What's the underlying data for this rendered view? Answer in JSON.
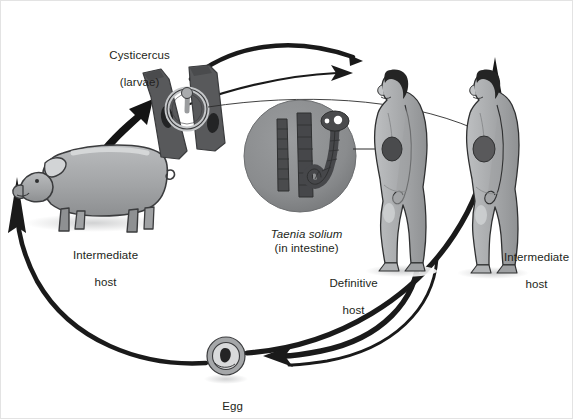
{
  "figure": {
    "background_color": "#ffffff",
    "border_color": "#e3e3e3"
  },
  "labels": {
    "cysticercus": "Cysticercus",
    "cysticercus_sub": "(larvae)",
    "taenia_species": "Taenia solium",
    "taenia_location": "(in intestine)",
    "pig_host_line1": "Intermediate",
    "pig_host_line2": "host",
    "definitive_line1": "Definitive",
    "definitive_line2": "host",
    "human_host_line1": "Intermediate",
    "human_host_line2": "host",
    "egg": "Egg"
  },
  "nodes": [
    {
      "id": "cysticercus-muscle",
      "name": "cysticercus-in-muscle",
      "caption": "Cysticercus (larvae)",
      "role": "larval stage encysted in striated muscle tissue"
    },
    {
      "id": "pig",
      "name": "pig-figure",
      "caption": "Intermediate host",
      "role": "pig intermediate host"
    },
    {
      "id": "tapeworm",
      "name": "tapeworm-circle",
      "caption": "Taenia solium (in intestine)",
      "role": "adult tapeworm proglottids and scolex"
    },
    {
      "id": "human-definitive",
      "name": "human-definitive-host",
      "caption": "Definitive host",
      "role": "human harboring adult tapeworm in intestine"
    },
    {
      "id": "human-intermediate",
      "name": "human-intermediate-host",
      "caption": "Intermediate host",
      "role": "human with cysticerci in tissue"
    },
    {
      "id": "egg",
      "name": "egg-figure",
      "caption": "Egg",
      "role": "egg shed in feces"
    }
  ],
  "arrows": [
    {
      "from": "pig",
      "to": "cysticercus-muscle",
      "style": "tapered-black"
    },
    {
      "from": "cysticercus-muscle",
      "to": "human-definitive",
      "style": "thick-curve-no-head"
    },
    {
      "from": "cysticercus-muscle",
      "to": "human-definitive",
      "style": "thin-curve-arrowhead"
    },
    {
      "from": "human-definitive",
      "to": "egg",
      "style": "thick-curve-arrowhead"
    },
    {
      "from": "human-intermediate",
      "to": "egg",
      "style": "thick-curve-arrowhead"
    },
    {
      "from": "egg",
      "to": "pig",
      "style": "thick-curve-arrowhead"
    },
    {
      "from": "egg",
      "to": "human-intermediate",
      "style": "thick-curve-arrowhead"
    },
    {
      "from": "tapeworm",
      "to": "human-definitive",
      "style": "leader-line"
    },
    {
      "from": "cysticercus-muscle",
      "to": "human-intermediate",
      "style": "leader-line"
    }
  ],
  "colors": {
    "skin": "#a7a9ab",
    "skin_light": "#c6c8ca",
    "skin_shadow": "#8e9092",
    "hair": "#2b2b2b",
    "muscle": "#5b5c5e",
    "muscle_dark": "#3a3b3d",
    "circle_fill": "#8a8c8e",
    "worm": "#4a4b4d",
    "arrow": "#1a1a1a",
    "outline": "#2b2b2b",
    "text": "#231f20",
    "shadow": "#d8d9da"
  }
}
